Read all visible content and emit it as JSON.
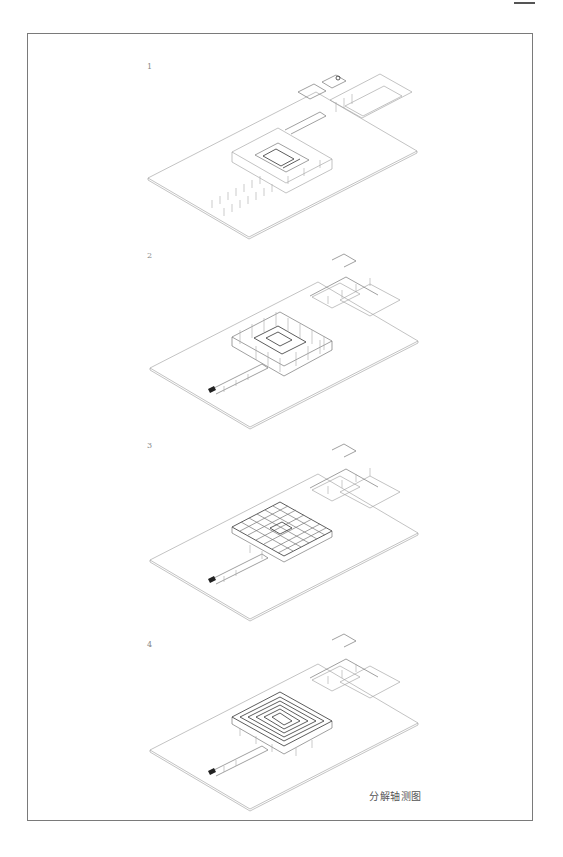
{
  "page": {
    "caption": "分解轴测图",
    "steps": [
      {
        "label": "1",
        "description": "site base with columns and courtyard core"
      },
      {
        "label": "2",
        "description": "structural frame with walls"
      },
      {
        "label": "3",
        "description": "floor slab grid"
      },
      {
        "label": "4",
        "description": "stepped roof terraces"
      }
    ]
  },
  "colors": {
    "frame": "#7a7a7a",
    "line": "#9a9a9a",
    "dark_line": "#333333",
    "label": "#888888",
    "caption": "#555555"
  }
}
